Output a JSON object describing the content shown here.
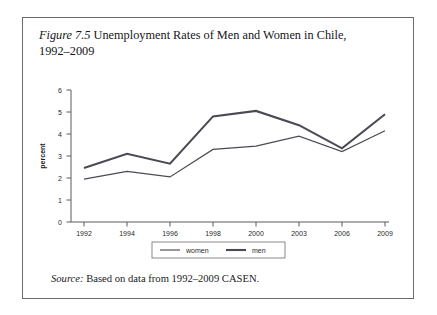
{
  "figure": {
    "label": "Figure 7.5",
    "caption": "Unemployment Rates of Men and Women in Chile, 1992–2009",
    "caption_line1": "Unemployment Rates of Men and Women in",
    "caption_line2": "Chile, 1992–2009"
  },
  "source": {
    "label": "Source:",
    "text": "Based on data from 1992–2009 CASEN."
  },
  "legend": {
    "position": "bottom-center",
    "entries": [
      {
        "name": "women",
        "label": "women",
        "style": "thick-line",
        "color": "#4a4a55"
      },
      {
        "name": "men",
        "label": "men",
        "style": "thin-line",
        "color": "#4a4a55"
      }
    ]
  },
  "axes": {
    "y": {
      "title": "percent",
      "ticks": [
        "0",
        "1",
        "2",
        "3",
        "4",
        "5",
        "6"
      ],
      "min": 0,
      "max": 6
    },
    "x": {
      "title": "",
      "ticks": [
        "1992",
        "1994",
        "1996",
        "1998",
        "2000",
        "2003",
        "2006",
        "2009"
      ]
    }
  },
  "chart_data": {
    "type": "line",
    "title": "Unemployment Rates of Men and Women in Chile, 1992–2009",
    "xlabel": "",
    "ylabel": "percent",
    "ylim": [
      0,
      6
    ],
    "grid": false,
    "legend_position": "bottom-center",
    "categories": [
      "1992",
      "1994",
      "1996",
      "1998",
      "2000",
      "2003",
      "2006",
      "2009"
    ],
    "x": [
      1992,
      1994,
      1996,
      1998,
      2000,
      2003,
      2006,
      2009
    ],
    "series": [
      {
        "name": "women",
        "values": [
          2.45,
          3.1,
          2.65,
          4.8,
          5.05,
          4.4,
          3.35,
          4.9
        ]
      },
      {
        "name": "men",
        "values": [
          1.95,
          2.3,
          2.05,
          3.3,
          3.45,
          3.9,
          3.2,
          4.15
        ]
      }
    ],
    "annotations": [
      "Source: Based on data from 1992–2009 CASEN."
    ]
  }
}
